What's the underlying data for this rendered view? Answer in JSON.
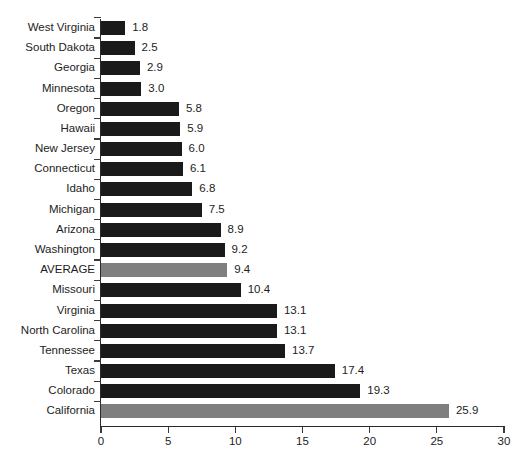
{
  "chart_data": {
    "type": "bar",
    "orientation": "horizontal",
    "title": "",
    "subtitle": "",
    "xlabel": "",
    "ylabel": "",
    "xlim": [
      0,
      30
    ],
    "xticks": [
      0,
      5,
      10,
      15,
      20,
      25,
      30
    ],
    "xtick_labels": [
      "0",
      "5",
      "10",
      "15",
      "20",
      "25",
      "30"
    ],
    "grid": false,
    "legend": "none",
    "bar_color": "#1a1a1a",
    "highlight_color": "#7f7f7f",
    "categories": [
      "West Virginia",
      "South Dakota",
      "Georgia",
      "Minnesota",
      "Oregon",
      "Hawaii",
      "New Jersey",
      "Connecticut",
      "Idaho",
      "Michigan",
      "Arizona",
      "Washington",
      "AVERAGE",
      "Missouri",
      "Virginia",
      "North Carolina",
      "Tennessee",
      "Texas",
      "Colorado",
      "California"
    ],
    "values": [
      1.8,
      2.5,
      2.9,
      3.0,
      5.8,
      5.9,
      6.0,
      6.1,
      6.8,
      7.5,
      8.9,
      9.2,
      9.4,
      10.4,
      13.1,
      13.1,
      13.7,
      17.4,
      19.3,
      25.9
    ],
    "value_labels": [
      "1.8",
      "2.5",
      "2.9",
      "3.0",
      "5.8",
      "5.9",
      "6.0",
      "6.1",
      "6.8",
      "7.5",
      "8.9",
      "9.2",
      "9.4",
      "10.4",
      "13.1",
      "13.1",
      "13.7",
      "17.4",
      "19.3",
      "25.9"
    ],
    "highlighted": [
      false,
      false,
      false,
      false,
      false,
      false,
      false,
      false,
      false,
      false,
      false,
      false,
      true,
      false,
      false,
      false,
      false,
      false,
      false,
      true
    ]
  }
}
